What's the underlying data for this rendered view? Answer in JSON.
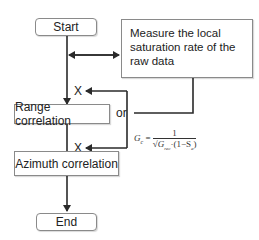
{
  "diagram": {
    "nodes": {
      "start": "Start",
      "measure": "Measure the local saturation rate of the raw data",
      "range": "Range correlation",
      "azimuth": "Azimuth correlation",
      "end": "End"
    },
    "labels": {
      "or": "or",
      "x_upper": "X",
      "x_lower": "X"
    },
    "formula": {
      "lhs": "G",
      "lhs_sub": "c",
      "eq": "=",
      "numerator": "1",
      "denominator_sqrt": "G",
      "denominator_sqrt_sub": "rec",
      "denominator_rest": "·(1−S",
      "denominator_rest_sub": "a",
      "denominator_close": ")"
    },
    "colors": {
      "line": "#2a2a2a",
      "box_border": "#8a8a8a"
    }
  }
}
